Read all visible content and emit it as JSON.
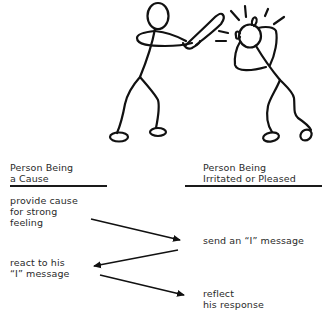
{
  "illustration": {
    "description": "Stick figure swinging a bat at another stick figure who is hit on the head",
    "stroke_color": "#111111"
  },
  "columns": {
    "left": {
      "header_line1": "Person Being",
      "header_line2": "a Cause"
    },
    "right": {
      "header_line1": "Person Being",
      "header_line2": "Irritated or Pleased"
    }
  },
  "steps": {
    "step1": {
      "line1": "provide cause",
      "line2": "for strong",
      "line3": "feeling"
    },
    "step2": {
      "line1": "send an “I” message"
    },
    "step3": {
      "line1": "react to his",
      "line2": "“I” message"
    },
    "step4": {
      "line1": "reflect",
      "line2": "his response"
    }
  },
  "arrows": [
    {
      "from": "step1",
      "to": "step2"
    },
    {
      "from": "step2",
      "to": "step3"
    },
    {
      "from": "step3",
      "to": "step4"
    }
  ]
}
